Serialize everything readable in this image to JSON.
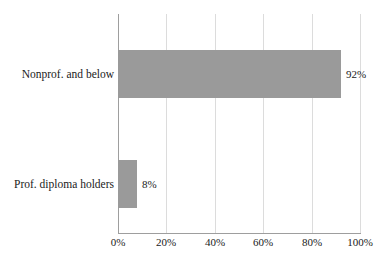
{
  "chart_data": {
    "type": "bar",
    "orientation": "horizontal",
    "title": "",
    "xlabel": "",
    "ylabel": "",
    "categories": [
      "Nonprof. and below",
      "Prof. diploma holders"
    ],
    "values": [
      92,
      8
    ],
    "value_labels": [
      "92%",
      "8%"
    ],
    "xlim": [
      0,
      100
    ],
    "xticks": [
      0,
      20,
      40,
      60,
      80,
      100
    ],
    "xtick_labels": [
      "0%",
      "20%",
      "40%",
      "60%",
      "80%",
      "100%"
    ],
    "grid": true,
    "legend": null,
    "series": [
      {
        "name": "",
        "values": [
          92,
          8
        ]
      }
    ],
    "colors": {
      "bar": "#9a9a9a",
      "gridline": "#dcdcdc",
      "axis": "#9e9e9e",
      "text": "#1a1a1a",
      "background": "#ffffff"
    }
  },
  "bars": [
    {
      "category": "Nonprof. and below",
      "value": 92,
      "value_label": "92%"
    },
    {
      "category": "Prof. diploma holders",
      "value": 8,
      "value_label": "8%"
    }
  ],
  "axis": {
    "ticks": [
      {
        "label": "0%",
        "value": 0
      },
      {
        "label": "20%",
        "value": 20
      },
      {
        "label": "40%",
        "value": 40
      },
      {
        "label": "60%",
        "value": 60
      },
      {
        "label": "80%",
        "value": 80
      },
      {
        "label": "100%",
        "value": 100
      }
    ]
  }
}
